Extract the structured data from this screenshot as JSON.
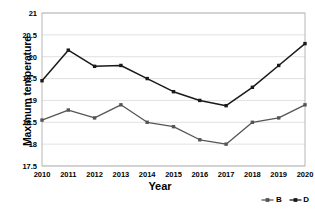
{
  "chart_data": {
    "type": "line",
    "title": "",
    "xlabel": "Year",
    "ylabel": "Maximum temperature",
    "categories": [
      "2010",
      "2011",
      "2012",
      "2013",
      "2014",
      "2015",
      "2016",
      "2017",
      "2018",
      "2019",
      "2020"
    ],
    "x": [
      2010,
      2011,
      2012,
      2013,
      2014,
      2015,
      2016,
      2017,
      2018,
      2019,
      2020
    ],
    "series": [
      {
        "name": "B",
        "color": "#555555",
        "values": [
          18.55,
          18.78,
          18.6,
          18.9,
          18.5,
          18.4,
          18.1,
          18.0,
          18.5,
          18.6,
          18.9
        ]
      },
      {
        "name": "D",
        "color": "#1a1a1a",
        "values": [
          19.45,
          20.15,
          19.78,
          19.8,
          19.5,
          19.2,
          19.0,
          18.88,
          19.3,
          19.8,
          20.3
        ]
      }
    ],
    "ylim": [
      17.5,
      21
    ],
    "yticks": [
      17.5,
      18,
      18.5,
      19,
      19.5,
      20,
      20.5,
      21
    ],
    "ytick_labels": [
      "17.5",
      "18",
      "18.5",
      "19",
      "19.5",
      "20",
      "20.5",
      "21"
    ],
    "grid": "horizontal",
    "legend_position": "bottom-right",
    "legend": [
      "B",
      "D"
    ]
  }
}
